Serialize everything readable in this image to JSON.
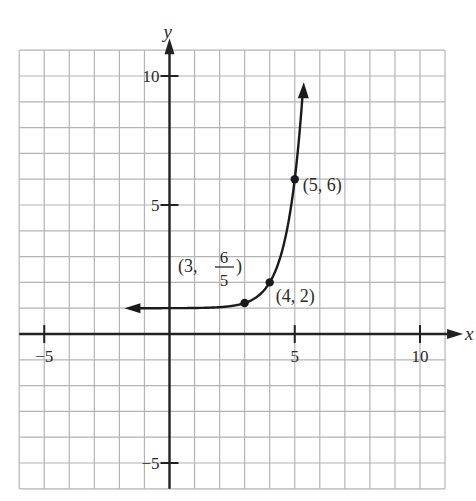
{
  "chart_data": {
    "type": "line",
    "title": "",
    "xlabel": "x",
    "ylabel": "y",
    "xlim": [
      -6,
      11
    ],
    "ylim": [
      -6,
      11
    ],
    "grid": true,
    "grid_step": 1,
    "x_ticks": [
      -5,
      5,
      10
    ],
    "y_ticks": [
      -5,
      5,
      10
    ],
    "x_tick_labels": [
      "−5",
      "5",
      "10"
    ],
    "y_tick_labels": [
      "−5",
      "5",
      "10"
    ],
    "series": [
      {
        "name": "y = 1 + 5^(x-4)",
        "function": "1 + 5^(x-4)",
        "domain": [
          -1.4,
          5.32
        ],
        "arrows": [
          "left",
          "up"
        ],
        "horizontal_asymptote": 1,
        "points": [
          {
            "x": 3,
            "y": 1.2,
            "label": "(3, 6/5)",
            "label_num": "6",
            "label_den": "5",
            "label_prefix": "(3, ",
            "label_suffix": ")"
          },
          {
            "x": 4,
            "y": 2,
            "label": "(4, 2)"
          },
          {
            "x": 5,
            "y": 6,
            "label": "(5, 6)"
          }
        ]
      }
    ]
  },
  "colors": {
    "grid": "#b4b4b4",
    "axis": "#222222",
    "curve": "#1a1a1a",
    "text": "#2a2a2a"
  }
}
